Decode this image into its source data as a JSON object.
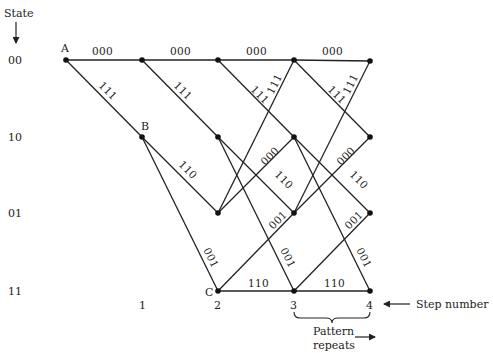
{
  "diagram": {
    "state_header": "State",
    "states": [
      {
        "label": "00",
        "y": 60
      },
      {
        "label": "10",
        "y": 137
      },
      {
        "label": "01",
        "y": 213
      },
      {
        "label": "11",
        "y": 291
      }
    ],
    "columns_x": [
      66,
      142,
      218,
      294,
      370
    ],
    "steps": [
      {
        "label": "1",
        "x": 142
      },
      {
        "label": "2",
        "x": 218
      },
      {
        "label": "3",
        "x": 294
      },
      {
        "label": "4",
        "x": 370
      }
    ],
    "node_labels": [
      {
        "label": "A",
        "col": 0,
        "row": 0
      },
      {
        "label": "B",
        "col": 1,
        "row": 1
      },
      {
        "label": "C",
        "col": 2,
        "row": 3
      }
    ],
    "transitions": [
      {
        "from": "00",
        "to": "00",
        "output": "000"
      },
      {
        "from": "00",
        "to": "10",
        "output": "111"
      },
      {
        "from": "10",
        "to": "01",
        "output": "110"
      },
      {
        "from": "10",
        "to": "11",
        "output": "001"
      },
      {
        "from": "01",
        "to": "00",
        "output": "111"
      },
      {
        "from": "01",
        "to": "10",
        "output": "000"
      },
      {
        "from": "11",
        "to": "01",
        "output": "001"
      },
      {
        "from": "11",
        "to": "11",
        "output": "110"
      }
    ],
    "step_number_label": "Step number",
    "pattern_label_line1": "Pattern",
    "pattern_label_line2": "repeats"
  }
}
